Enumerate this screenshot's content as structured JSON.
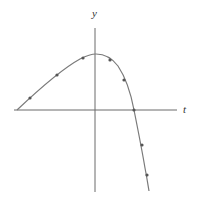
{
  "diagram": {
    "type": "graph-of-function",
    "axes": {
      "x_label": "t",
      "y_label": "y",
      "origin_px": [
        95,
        110
      ],
      "x_axis_px": [
        14,
        177
      ],
      "y_axis_px": [
        28,
        192
      ]
    },
    "curve": {
      "description": "Smooth curve rising from the left on the t-axis to a maximum near the y-axis, then falling steeply, crossing the positive t-axis and descending below",
      "path_points_px": [
        [
          17,
          110
        ],
        [
          30,
          98
        ],
        [
          57,
          75
        ],
        [
          83,
          58
        ],
        [
          95,
          54
        ],
        [
          110,
          60
        ],
        [
          124,
          80
        ],
        [
          134,
          110
        ],
        [
          142,
          145
        ],
        [
          147,
          175
        ],
        [
          149,
          191
        ]
      ],
      "direction_markers_px": [
        [
          30,
          98
        ],
        [
          57,
          75
        ],
        [
          83,
          58
        ],
        [
          110,
          60
        ],
        [
          124,
          80
        ],
        [
          134,
          110
        ],
        [
          142,
          145
        ],
        [
          147,
          175
        ]
      ]
    },
    "colors": {
      "axis": "#6a6a6a",
      "curve": "#7a7a7a",
      "marker": "#555555",
      "background": "#ffffff"
    }
  }
}
